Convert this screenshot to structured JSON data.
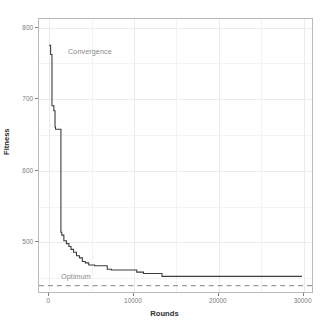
{
  "chart_data": {
    "type": "line",
    "title": "",
    "subtitle": "",
    "xlabel": "Rounds",
    "ylabel": "Fitness",
    "xlim": [
      -1200,
      31200
    ],
    "ylim": [
      428,
      812
    ],
    "xticks": [
      0,
      10000,
      20000,
      30000
    ],
    "xtick_labels": [
      "0",
      "10000",
      "20000",
      "30000"
    ],
    "yticks": [
      500,
      600,
      700,
      800
    ],
    "ytick_labels": [
      "500",
      "600",
      "700",
      "800"
    ],
    "grid": true,
    "grid_minor": true,
    "legend": "none",
    "series": [
      {
        "name": "Convergence",
        "style": "step",
        "color": "#3c3c3c",
        "x": [
          0,
          180,
          180,
          340,
          340,
          560,
          560,
          700,
          700,
          760,
          760,
          1400,
          1400,
          1500,
          1500,
          1750,
          1750,
          2050,
          2050,
          2350,
          2350,
          2600,
          2600,
          2900,
          2900,
          3250,
          3250,
          3600,
          3600,
          3950,
          3950,
          4300,
          4300,
          4700,
          4700,
          5400,
          5400,
          6900,
          6900,
          7400,
          7400,
          10400,
          10400,
          11200,
          11200,
          13400,
          13400,
          30000
        ],
        "y": [
          775,
          775,
          762,
          762,
          690,
          690,
          683,
          683,
          660,
          660,
          657,
          657,
          512,
          512,
          508,
          508,
          500,
          500,
          496,
          496,
          492,
          492,
          488,
          488,
          484,
          484,
          479,
          479,
          476,
          476,
          471,
          471,
          469,
          469,
          466,
          466,
          465,
          465,
          460,
          460,
          459,
          459,
          456,
          456,
          454,
          454,
          450,
          450
        ]
      }
    ],
    "reference_lines": [
      {
        "name": "Optimum",
        "orientation": "horizontal",
        "value": 437,
        "style": "dashed",
        "color": "#9a9a9a"
      }
    ],
    "annotations": [
      {
        "name": "Convergence",
        "text": "Convergence",
        "x": 2500,
        "y": 756,
        "color": "#8a8a8a"
      },
      {
        "name": "Optimum",
        "text": "Optimum",
        "x": 1100,
        "y": 448,
        "color": "#8a8a8a"
      }
    ]
  },
  "panel": {
    "background": "#ffffff",
    "border_color": "#b9b9b9",
    "grid_major_color": "#ebebeb",
    "grid_minor_color": "#f3f3f3"
  }
}
